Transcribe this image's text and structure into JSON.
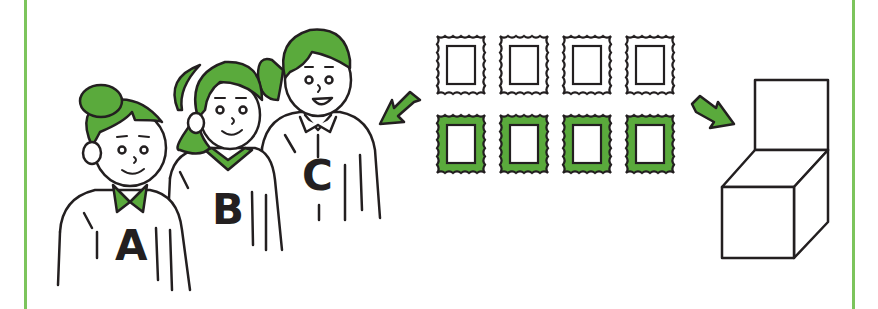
{
  "figure": {
    "colors": {
      "accent": "#5aaa3c",
      "accent_dark": "#3f8a2a",
      "frame": "#7cc45c",
      "outline": "#231f20",
      "background": "#ffffff"
    },
    "people": [
      {
        "label": "A"
      },
      {
        "label": "B"
      },
      {
        "label": "C"
      }
    ],
    "stamps": {
      "rows": 2,
      "per_row": 4,
      "top_row_fill": "white",
      "bottom_row_fill": "green"
    },
    "arrows": [
      {
        "name": "arrow-to-people",
        "direction": "down-left"
      },
      {
        "name": "arrow-to-box",
        "direction": "down-right"
      }
    ]
  }
}
